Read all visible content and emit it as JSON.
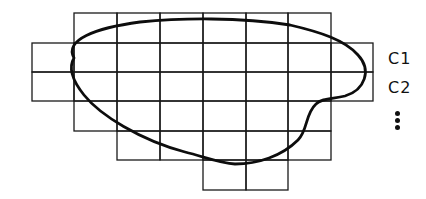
{
  "diagram": {
    "grid": {
      "column_lines_x": [
        32,
        74,
        117,
        160,
        203,
        246,
        288,
        331,
        373
      ],
      "row_lines_y": [
        13,
        43,
        72,
        101,
        131,
        160,
        190
      ],
      "rows": [
        {
          "index": 0,
          "from_col": 1,
          "to_col": 7
        },
        {
          "index": 1,
          "from_col": 0,
          "to_col": 8
        },
        {
          "index": 2,
          "from_col": 0,
          "to_col": 8
        },
        {
          "index": 3,
          "from_col": 1,
          "to_col": 7
        },
        {
          "index": 4,
          "from_col": 2,
          "to_col": 7
        },
        {
          "index": 5,
          "from_col": 4,
          "to_col": 6
        }
      ],
      "line_color": "#1a1a1a"
    },
    "curve": {
      "shape": "closed-blob",
      "color": "#0d0d0d"
    },
    "labels": {
      "row1": "C1",
      "row2": "C2",
      "more": "vertical-ellipsis"
    }
  }
}
